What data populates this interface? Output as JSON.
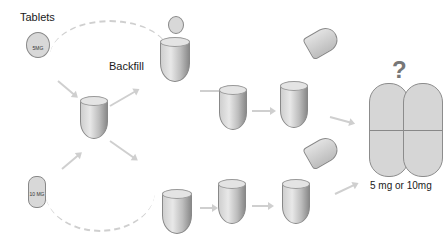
{
  "labels": {
    "tablets": "Tablets",
    "backfill": "Backfill",
    "dose": "5 mg or 10mg",
    "question": "?"
  },
  "tablets": [
    {
      "id": "top",
      "text": "5MG"
    },
    {
      "id": "bottom",
      "text": "10 MG"
    }
  ],
  "steps": {
    "top_row": [
      "tablet-into-cup",
      "tablet-in-cup-backfilled",
      "closed-capsule"
    ],
    "bottom_row": [
      "tablet-into-cup",
      "tablet-in-cup-backfilled",
      "closed-capsule"
    ]
  },
  "colors": {
    "accent": "#777777",
    "line": "#cfcfcf"
  }
}
